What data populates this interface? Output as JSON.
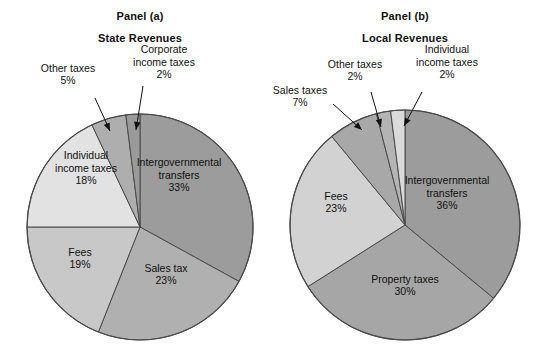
{
  "figure": {
    "background": "#ffffff",
    "width": 542,
    "height": 361
  },
  "panels": [
    {
      "id": "panel-a",
      "title": "Panel (a)",
      "subtitle": "State Revenues"
    },
    {
      "id": "panel-b",
      "title": "Panel (b)",
      "subtitle": "Local Revenues"
    }
  ],
  "chart_data": [
    {
      "type": "pie",
      "title": "Panel (a)",
      "subtitle": "State Revenues",
      "start_angle": 0,
      "direction": "clockwise",
      "center": [
        140,
        227
      ],
      "radius": 113,
      "labels": [
        "Intergovernmental transfers",
        "Sales tax",
        "Fees",
        "Individual income taxes",
        "Other taxes",
        "Corporate income taxes"
      ],
      "values": [
        33,
        23,
        19,
        18,
        5,
        2
      ],
      "value_labels": [
        "33%",
        "23%",
        "19%",
        "18%",
        "5%",
        "2%"
      ],
      "colors": [
        "#9c9c9c",
        "#b0b0b0",
        "#c8c8c8",
        "#e2e2e2",
        "#aeaeae",
        "#9a9a9a"
      ],
      "slices": [
        {
          "name": "Intergovernmental transfers",
          "value": 33,
          "value_label": "33%",
          "color": "#9c9c9c",
          "label_placement": "inside",
          "label_lines": [
            "Intergovernmental",
            "transfers",
            "33%"
          ],
          "label_pos": [
            179,
            175
          ]
        },
        {
          "name": "Sales tax",
          "value": 23,
          "value_label": "23%",
          "color": "#b0b0b0",
          "label_placement": "inside",
          "label_lines": [
            "Sales tax",
            "23%"
          ],
          "label_pos": [
            166,
            274
          ]
        },
        {
          "name": "Fees",
          "value": 19,
          "value_label": "19%",
          "color": "#c8c8c8",
          "label_placement": "inside",
          "label_lines": [
            "Fees",
            "19%"
          ],
          "label_pos": [
            80,
            258
          ]
        },
        {
          "name": "Individual income taxes",
          "value": 18,
          "value_label": "18%",
          "color": "#e2e2e2",
          "label_placement": "inside",
          "label_lines": [
            "Individual",
            "income taxes",
            "18%"
          ],
          "label_pos": [
            86,
            168
          ]
        },
        {
          "name": "Other taxes",
          "value": 5,
          "value_label": "5%",
          "color": "#aeaeae",
          "label_placement": "callout",
          "label_lines": [
            "Other taxes",
            "5%"
          ],
          "label_pos": [
            68,
            74
          ]
        },
        {
          "name": "Corporate income taxes",
          "value": 2,
          "value_label": "2%",
          "color": "#9a9a9a",
          "label_placement": "callout",
          "label_lines": [
            "Corporate",
            "income taxes",
            "2%"
          ],
          "label_pos": [
            164,
            62
          ]
        }
      ]
    },
    {
      "type": "pie",
      "title": "Panel (b)",
      "subtitle": "Local Revenues",
      "start_angle": 0,
      "direction": "clockwise",
      "center": [
        405,
        225
      ],
      "radius": 115,
      "labels": [
        "Intergovernmental transfers",
        "Property taxes",
        "Fees",
        "Sales taxes",
        "Other taxes",
        "Individual income taxes"
      ],
      "values": [
        36,
        30,
        23,
        7,
        2,
        2
      ],
      "value_labels": [
        "36%",
        "30%",
        "23%",
        "7%",
        "2%",
        "2%"
      ],
      "colors": [
        "#9c9c9c",
        "#a6a6a6",
        "#d2d2d2",
        "#a8a8a8",
        "#b4b4b4",
        "#dadada"
      ],
      "slices": [
        {
          "name": "Intergovernmental transfers",
          "value": 36,
          "value_label": "36%",
          "color": "#9c9c9c",
          "label_placement": "inside",
          "label_lines": [
            "Intergovernmental",
            "transfers",
            "36%"
          ],
          "label_pos": [
            447,
            193
          ]
        },
        {
          "name": "Property taxes",
          "value": 30,
          "value_label": "30%",
          "color": "#a6a6a6",
          "label_placement": "inside",
          "label_lines": [
            "Property taxes",
            "30%"
          ],
          "label_pos": [
            405,
            285
          ]
        },
        {
          "name": "Fees",
          "value": 23,
          "value_label": "23%",
          "color": "#d2d2d2",
          "label_placement": "inside",
          "label_lines": [
            "Fees",
            "23%"
          ],
          "label_pos": [
            336,
            202
          ]
        },
        {
          "name": "Sales taxes",
          "value": 7,
          "value_label": "7%",
          "color": "#a8a8a8",
          "label_placement": "callout",
          "label_lines": [
            "Sales taxes",
            "7%"
          ],
          "label_pos": [
            300,
            96
          ]
        },
        {
          "name": "Other taxes",
          "value": 2,
          "value_label": "2%",
          "color": "#b4b4b4",
          "label_placement": "callout",
          "label_lines": [
            "Other taxes",
            "2%"
          ],
          "label_pos": [
            355,
            70
          ]
        },
        {
          "name": "Individual income taxes",
          "value": 2,
          "value_label": "2%",
          "color": "#dadada",
          "label_placement": "callout",
          "label_lines": [
            "Individual",
            "income taxes",
            "2%"
          ],
          "label_pos": [
            447,
            62
          ]
        }
      ]
    }
  ],
  "leaders": [
    {
      "name": "leader-other-taxes-a",
      "from": [
        95,
        98
      ],
      "to": [
        110,
        131
      ]
    },
    {
      "name": "leader-corporate-income-taxes-a",
      "from": [
        143,
        86
      ],
      "to": [
        136,
        130
      ]
    },
    {
      "name": "leader-sales-taxes-b",
      "from": [
        333,
        104
      ],
      "to": [
        362,
        130
      ]
    },
    {
      "name": "leader-other-taxes-b",
      "from": [
        371,
        92
      ],
      "to": [
        381,
        127
      ]
    },
    {
      "name": "leader-individual-income-taxes-b",
      "from": [
        422,
        92
      ],
      "to": [
        404,
        126
      ]
    }
  ]
}
